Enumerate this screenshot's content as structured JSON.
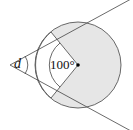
{
  "diagram": {
    "angle_label": "d",
    "central_angle_label": "100°",
    "colors": {
      "shade": "#e6e6e6",
      "stroke": "#333333"
    }
  }
}
